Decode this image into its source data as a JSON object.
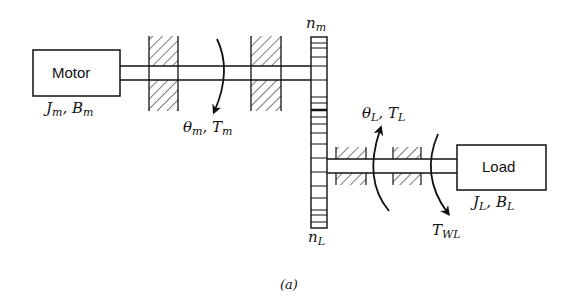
{
  "diagram": {
    "type": "mechanical gear train schematic",
    "motor": {
      "label": "Motor",
      "inertia_symbol": "J",
      "inertia_sub": "m",
      "friction_symbol": "B",
      "friction_sub": "m"
    },
    "load": {
      "label": "Load",
      "inertia_symbol": "J",
      "inertia_sub": "L",
      "friction_symbol": "B",
      "friction_sub": "L"
    },
    "motor_shaft": {
      "angle_symbol": "θ",
      "angle_sub": "m",
      "torque_symbol": "T",
      "torque_sub": "m"
    },
    "load_shaft": {
      "angle_symbol": "θ",
      "angle_sub": "L",
      "torque_symbol": "T",
      "torque_sub": "L",
      "disturbance_symbol": "T",
      "disturbance_sub": "WL"
    },
    "gear_top": {
      "symbol": "n",
      "sub": "m"
    },
    "gear_bottom": {
      "symbol": "n",
      "sub": "L"
    },
    "separator": ",",
    "caption": "(a)",
    "colors": {
      "line": "#111111",
      "background": "#ffffff"
    }
  }
}
